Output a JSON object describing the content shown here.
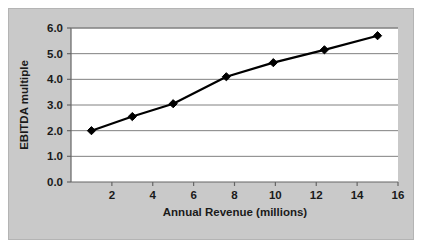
{
  "chart_data": {
    "type": "line",
    "title": "",
    "xlabel": "Annual Revenue (millions)",
    "ylabel": "EBITDA multiple",
    "xlim": [
      0,
      16
    ],
    "ylim": [
      0,
      6
    ],
    "grid": "horizontal",
    "legend": "none",
    "marker": "diamond",
    "line_color": "#000000",
    "marker_color": "#000000",
    "plot_background": "#ffffff",
    "figure_background": "#c9c9c9",
    "gridline_color": "#808080",
    "xticks": [
      2,
      4,
      6,
      8,
      10,
      12,
      14,
      16
    ],
    "xtick_labels": [
      "2",
      "4",
      "6",
      "8",
      "10",
      "12",
      "14",
      "16"
    ],
    "yticks": [
      0,
      1,
      2,
      3,
      4,
      5,
      6
    ],
    "ytick_labels": [
      "0.0",
      "1.0",
      "2.0",
      "3.0",
      "4.0",
      "5.0",
      "6.0"
    ],
    "x": [
      1.0,
      3.0,
      5.0,
      7.6,
      9.9,
      12.4,
      15.0
    ],
    "y": [
      2.0,
      2.55,
      3.05,
      4.1,
      4.65,
      5.15,
      5.7
    ],
    "series": [
      {
        "name": "EBITDA multiple vs Annual Revenue",
        "points": [
          {
            "x": 1.0,
            "y": 2.0
          },
          {
            "x": 3.0,
            "y": 2.55
          },
          {
            "x": 5.0,
            "y": 3.05
          },
          {
            "x": 7.6,
            "y": 4.1
          },
          {
            "x": 9.9,
            "y": 4.65
          },
          {
            "x": 12.4,
            "y": 5.15
          },
          {
            "x": 15.0,
            "y": 5.7
          }
        ]
      }
    ]
  }
}
